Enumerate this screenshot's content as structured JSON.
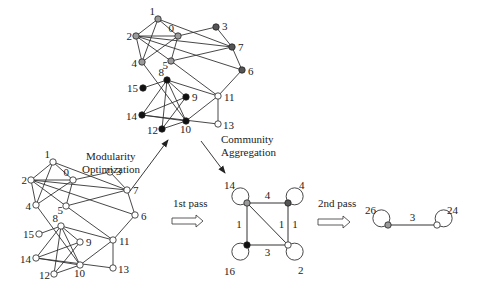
{
  "colors": {
    "community_gray": "#9a9a9a",
    "community_dark": "#555555",
    "community_black": "#111111",
    "community_white": "#ffffff",
    "edge": "#333333"
  },
  "captions": {
    "modularity_line1": "Modularity",
    "modularity_line2": "Optimization",
    "aggregation_line1": "Community",
    "aggregation_line2": "Aggregation",
    "first_pass": "1st pass",
    "second_pass": "2nd pass"
  },
  "original_graph": {
    "nodes": [
      {
        "id": "0",
        "label": "0",
        "x": 73,
        "y": 180,
        "community": "gray"
      },
      {
        "id": "1",
        "label": "1",
        "x": 53,
        "y": 162,
        "community": "gray"
      },
      {
        "id": "2",
        "label": "2",
        "x": 31,
        "y": 180,
        "community": "gray"
      },
      {
        "id": "3",
        "label": "3",
        "x": 110,
        "y": 172,
        "community": "dark"
      },
      {
        "id": "4",
        "label": "4",
        "x": 36,
        "y": 205,
        "community": "gray"
      },
      {
        "id": "5",
        "label": "5",
        "x": 66,
        "y": 206,
        "community": "gray"
      },
      {
        "id": "6",
        "label": "6",
        "x": 135,
        "y": 215,
        "community": "dark"
      },
      {
        "id": "7",
        "label": "7",
        "x": 127,
        "y": 190,
        "community": "dark"
      },
      {
        "id": "8",
        "label": "8",
        "x": 61,
        "y": 226,
        "community": "black"
      },
      {
        "id": "9",
        "label": "9",
        "x": 80,
        "y": 242,
        "community": "black"
      },
      {
        "id": "10",
        "label": "10",
        "x": 80,
        "y": 265,
        "community": "black"
      },
      {
        "id": "11",
        "label": "11",
        "x": 113,
        "y": 240,
        "community": "white"
      },
      {
        "id": "12",
        "label": "12",
        "x": 54,
        "y": 274,
        "community": "black"
      },
      {
        "id": "13",
        "label": "13",
        "x": 113,
        "y": 268,
        "community": "white"
      },
      {
        "id": "14",
        "label": "14",
        "x": 36,
        "y": 258,
        "community": "black"
      },
      {
        "id": "15",
        "label": "15",
        "x": 39,
        "y": 234,
        "community": "black"
      }
    ],
    "edges": [
      [
        "1",
        "2"
      ],
      [
        "1",
        "4"
      ],
      [
        "1",
        "7"
      ],
      [
        "1",
        "0"
      ],
      [
        "2",
        "0"
      ],
      [
        "2",
        "4"
      ],
      [
        "2",
        "5"
      ],
      [
        "2",
        "6"
      ],
      [
        "2",
        "7"
      ],
      [
        "0",
        "3"
      ],
      [
        "0",
        "4"
      ],
      [
        "0",
        "5"
      ],
      [
        "3",
        "7"
      ],
      [
        "7",
        "5"
      ],
      [
        "7",
        "6"
      ],
      [
        "6",
        "11"
      ],
      [
        "4",
        "10"
      ],
      [
        "5",
        "11"
      ],
      [
        "8",
        "15"
      ],
      [
        "8",
        "14"
      ],
      [
        "8",
        "10"
      ],
      [
        "8",
        "11"
      ],
      [
        "8",
        "9"
      ],
      [
        "8",
        "12"
      ],
      [
        "9",
        "14"
      ],
      [
        "9",
        "12"
      ],
      [
        "14",
        "10"
      ],
      [
        "14",
        "13"
      ],
      [
        "10",
        "11"
      ],
      [
        "10",
        "12"
      ],
      [
        "11",
        "13"
      ]
    ]
  },
  "phase1_graph": {
    "nodes": [
      {
        "id": "0",
        "label": "0",
        "x": 178,
        "y": 36,
        "community": "gray"
      },
      {
        "id": "1",
        "label": "1",
        "x": 158,
        "y": 19,
        "community": "gray"
      },
      {
        "id": "2",
        "label": "2",
        "x": 136,
        "y": 36,
        "community": "gray"
      },
      {
        "id": "3",
        "label": "3",
        "x": 216,
        "y": 27,
        "community": "dark"
      },
      {
        "id": "4",
        "label": "4",
        "x": 142,
        "y": 62,
        "community": "gray"
      },
      {
        "id": "5",
        "label": "5",
        "x": 171,
        "y": 61,
        "community": "gray"
      },
      {
        "id": "6",
        "label": "6",
        "x": 242,
        "y": 70,
        "community": "dark"
      },
      {
        "id": "7",
        "label": "7",
        "x": 232,
        "y": 47,
        "community": "dark"
      },
      {
        "id": "8",
        "label": "8",
        "x": 167,
        "y": 80,
        "community": "black"
      },
      {
        "id": "9",
        "label": "9",
        "x": 186,
        "y": 97,
        "community": "black"
      },
      {
        "id": "10",
        "label": "10",
        "x": 186,
        "y": 121,
        "community": "black"
      },
      {
        "id": "11",
        "label": "11",
        "x": 218,
        "y": 96,
        "community": "white"
      },
      {
        "id": "12",
        "label": "12",
        "x": 162,
        "y": 129,
        "community": "black"
      },
      {
        "id": "13",
        "label": "13",
        "x": 218,
        "y": 124,
        "community": "white"
      },
      {
        "id": "14",
        "label": "14",
        "x": 142,
        "y": 115,
        "community": "black"
      },
      {
        "id": "15",
        "label": "15",
        "x": 143,
        "y": 88,
        "community": "black"
      }
    ]
  },
  "pass1_graph": {
    "nodes": [
      {
        "id": "14",
        "label": "14",
        "x": 247,
        "y": 203,
        "community": "gray",
        "self_loop": "top-left"
      },
      {
        "id": "4",
        "label": "4",
        "x": 288,
        "y": 203,
        "community": "dark",
        "self_loop": "top-right"
      },
      {
        "id": "16",
        "label": "16",
        "x": 247,
        "y": 245,
        "community": "black",
        "self_loop": "bottom-left"
      },
      {
        "id": "2",
        "label": "2",
        "x": 288,
        "y": 245,
        "community": "white",
        "self_loop": "bottom-right"
      }
    ],
    "edges": [
      {
        "from": "14",
        "to": "4",
        "weight": "4"
      },
      {
        "from": "14",
        "to": "16",
        "weight": "1"
      },
      {
        "from": "14",
        "to": "2",
        "weight": "1"
      },
      {
        "from": "4",
        "to": "2",
        "weight": "1"
      },
      {
        "from": "16",
        "to": "2",
        "weight": "3"
      }
    ]
  },
  "pass2_graph": {
    "nodes": [
      {
        "id": "26",
        "label": "26",
        "x": 388,
        "y": 225,
        "community": "gray",
        "self_loop": "top-left"
      },
      {
        "id": "24",
        "label": "24",
        "x": 437,
        "y": 225,
        "community": "white",
        "self_loop": "top-right"
      }
    ],
    "edges": [
      {
        "from": "26",
        "to": "24",
        "weight": "3"
      }
    ]
  }
}
